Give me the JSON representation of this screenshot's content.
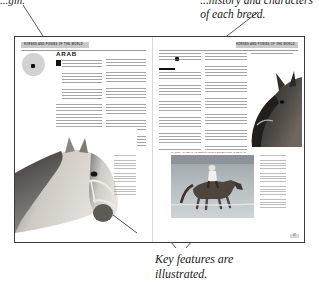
{
  "figure": {
    "kind": "annotated-book-spread",
    "annotations": [
      {
        "id": "origin",
        "text": "...gin.",
        "target": "breed-origin-map-circle"
      },
      {
        "id": "history",
        "text": "...history and characters\nof each breed.",
        "target": "breed-description-text"
      },
      {
        "id": "features",
        "text": "Key features are\nillustrated.",
        "target": "illustrated-key-features"
      }
    ]
  },
  "spread": {
    "left_page": {
      "running_head": "HORSES AND PONIES OF THE WORLD",
      "headline": "ARAB",
      "page_number": "",
      "photo_caption": "",
      "drop_cap": "T"
    },
    "right_page": {
      "running_head": "HORSES AND PONIES OF THE WORLD",
      "subhead": "The Arab today",
      "photo_caption": "RACING ARABS IN AN ENDURANCE COMPETITION IN BRITAIN",
      "page_number": "37"
    }
  },
  "colors": {
    "paper": "#ffffff",
    "ink": "#1a1a1a",
    "banner": "#c9c9c9",
    "callout_circle": "#d2d2d2",
    "rule": "#9a9a9a",
    "border": "#3a3a3a"
  }
}
